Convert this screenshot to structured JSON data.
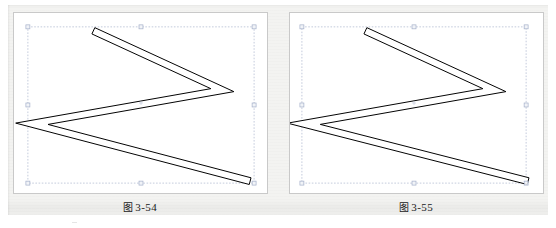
{
  "page": {
    "background_color": "#f3f3f1",
    "panel_color": "#ffffff",
    "panel_border_color": "#c9c9c9",
    "stroke_color": "#000000",
    "selection_color": "#9aa7c4"
  },
  "figures": [
    {
      "id": "figure-3-54",
      "caption_cjk": "图",
      "caption_number": "3-54",
      "caption": "图 3-54",
      "shape": {
        "name": "zigzag-double-line",
        "description": "open compound path of two parallel zigzag strokes forming a sideways V / K outline",
        "stroke_color": "#000000",
        "fill_color": "#ffffff",
        "join": "miter",
        "vertices": [
          {
            "x": 80,
            "y": 18
          },
          {
            "x": 210,
            "y": 78
          },
          {
            "x": 18,
            "y": 112
          },
          {
            "x": 238,
            "y": 170
          }
        ],
        "offset": 7
      },
      "selection": {
        "visible": true,
        "box": {
          "x": 14,
          "y": 14,
          "width": 228,
          "height": 158
        },
        "handles": 8,
        "center_marker": true
      }
    },
    {
      "id": "figure-3-55",
      "caption_cjk": "图",
      "caption_number": "3-55",
      "caption": "图 3-55",
      "shape": {
        "name": "zigzag-double-line",
        "description": "open compound path of two parallel zigzag strokes forming a sideways V / K outline with sharp mitered left vertex",
        "stroke_color": "#000000",
        "fill_color": "#ffffff",
        "join": "miter",
        "vertices": [
          {
            "x": 76,
            "y": 18
          },
          {
            "x": 206,
            "y": 78
          },
          {
            "x": 14,
            "y": 112
          },
          {
            "x": 240,
            "y": 170
          }
        ],
        "offset": 7
      },
      "selection": {
        "visible": true,
        "box": {
          "x": 12,
          "y": 14,
          "width": 226,
          "height": 158
        },
        "handles": 8,
        "center_marker": true
      }
    }
  ]
}
